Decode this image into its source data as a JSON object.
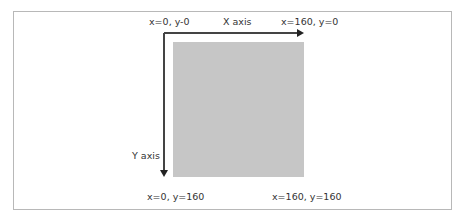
{
  "diagram": {
    "corner_labels": {
      "top_left": "x=0, y-0",
      "top_right": "x=160, y=0",
      "bottom_left": "x=0, y=160",
      "bottom_right": "x=160, y=160"
    },
    "axis_labels": {
      "x": "X axis",
      "y": "Y axis"
    },
    "square_color": "#c6c6c6",
    "frame_color": "#b8b8b8",
    "axis_color": "#444444"
  }
}
